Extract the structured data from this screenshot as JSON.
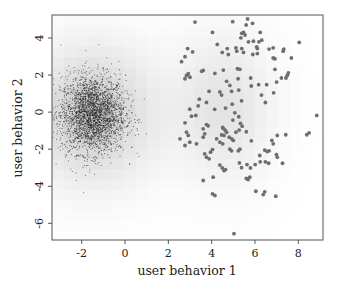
{
  "chart_data": {
    "type": "scatter",
    "title": "",
    "xlabel": "user behavior 1",
    "ylabel": "user behavior 2",
    "xlim": [
      -3.37,
      9.14
    ],
    "ylim": [
      -6.9,
      5.24
    ],
    "xticks": [
      -2,
      0,
      2,
      4,
      6,
      8
    ],
    "xtick_labels": [
      "-2",
      "0",
      "2",
      "4",
      "6",
      "8"
    ],
    "yticks": [
      -6,
      -4,
      -2,
      0,
      2,
      4
    ],
    "ytick_labels": [
      "-6",
      "-4",
      "-2",
      "0",
      "2",
      "4"
    ],
    "grid": false,
    "legend": null,
    "background": {
      "type": "heatmap",
      "description": "blocky grayscale density estimate, darkest near (-1.5, 0), fading to white toward right and bottom",
      "colormap": [
        "#ffffff",
        "#bdbdbd"
      ]
    },
    "series": [
      {
        "name": "dense cluster",
        "marker": "small dot",
        "color": "#222222",
        "center": [
          -1.5,
          -0.1
        ],
        "spread": [
          0.75,
          1.05
        ],
        "approx_count": 2500
      },
      {
        "name": "sparse cluster",
        "marker": "filled circle",
        "color": "#6e6e6e",
        "points": [
          [
            3.23,
            4.86
          ],
          [
            4.97,
            4.88
          ],
          [
            5.66,
            5.03
          ],
          [
            5.89,
            4.79
          ],
          [
            5.59,
            4.7
          ],
          [
            5.39,
            4.25
          ],
          [
            5.47,
            4.3
          ],
          [
            5.54,
            4.16
          ],
          [
            5.35,
            4.01
          ],
          [
            5.7,
            3.79
          ],
          [
            5.93,
            3.83
          ],
          [
            6.24,
            4.3
          ],
          [
            6.31,
            3.88
          ],
          [
            6.18,
            3.79
          ],
          [
            6.08,
            3.52
          ],
          [
            6.11,
            3.43
          ],
          [
            4.04,
            4.3
          ],
          [
            4.26,
            3.65
          ],
          [
            4.49,
            3.22
          ],
          [
            4.72,
            3.43
          ],
          [
            4.77,
            3.11
          ],
          [
            5.12,
            3.47
          ],
          [
            5.39,
            3.43
          ],
          [
            5.16,
            3.29
          ],
          [
            5.47,
            3.22
          ],
          [
            5.9,
            3.11
          ],
          [
            6.11,
            3.16
          ],
          [
            6.65,
            3.4
          ],
          [
            6.84,
            3.47
          ],
          [
            7.33,
            3.4
          ],
          [
            7.3,
            3.29
          ],
          [
            8.04,
            3.76
          ],
          [
            7.68,
            2.92
          ],
          [
            6.84,
            2.92
          ],
          [
            6.92,
            2.88
          ],
          [
            6.92,
            2.31
          ],
          [
            7.22,
            1.84
          ],
          [
            7.43,
            1.84
          ],
          [
            7.49,
            1.98
          ],
          [
            7.54,
            2.11
          ],
          [
            7.0,
            1.62
          ],
          [
            6.86,
            1.04
          ],
          [
            6.54,
            1.48
          ],
          [
            6.48,
            0.52
          ],
          [
            6.3,
            0.92
          ],
          [
            6.17,
            1.48
          ],
          [
            5.8,
            1.84
          ],
          [
            5.83,
            1.41
          ],
          [
            5.22,
            1.8
          ],
          [
            5.19,
            2.34
          ],
          [
            5.3,
            2.31
          ],
          [
            4.84,
            1.44
          ],
          [
            4.69,
            1.66
          ],
          [
            4.38,
            1.09
          ],
          [
            4.46,
            0.92
          ],
          [
            4.15,
            2.09
          ],
          [
            4.54,
            2.27
          ],
          [
            4.92,
            1.12
          ],
          [
            5.25,
            1.19
          ],
          [
            5.38,
            0.61
          ],
          [
            5.07,
            -0.04
          ],
          [
            5.25,
            -0.25
          ],
          [
            5.33,
            -0.61
          ],
          [
            5.41,
            -0.76
          ],
          [
            4.98,
            -0.43
          ],
          [
            4.95,
            0.43
          ],
          [
            4.64,
            0.22
          ],
          [
            4.54,
            -0.88
          ],
          [
            4.62,
            -0.97
          ],
          [
            4.51,
            -0.83
          ],
          [
            3.88,
            1.12
          ],
          [
            4.14,
            0.15
          ],
          [
            3.76,
            0.52
          ],
          [
            3.43,
            0.7
          ],
          [
            3.38,
            0.34
          ],
          [
            2.84,
            1.98
          ],
          [
            2.92,
            2.07
          ],
          [
            3.0,
            1.88
          ],
          [
            2.77,
            1.8
          ],
          [
            3.12,
            3.25
          ],
          [
            2.89,
            3.43
          ],
          [
            2.77,
            2.99
          ],
          [
            2.61,
            2.72
          ],
          [
            3.54,
            2.2
          ],
          [
            3.61,
            2.25
          ],
          [
            2.99,
            0.16
          ],
          [
            3.07,
            -0.22
          ],
          [
            3.27,
            -0.18
          ],
          [
            2.77,
            -0.58
          ],
          [
            2.84,
            -1.08
          ],
          [
            2.92,
            -1.26
          ],
          [
            2.99,
            -1.62
          ],
          [
            3.61,
            -0.9
          ],
          [
            3.68,
            -1.17
          ],
          [
            3.76,
            -0.67
          ],
          [
            3.84,
            -0.74
          ],
          [
            3.61,
            -1.35
          ],
          [
            3.3,
            -1.71
          ],
          [
            3.68,
            -2.25
          ],
          [
            3.76,
            -2.43
          ],
          [
            3.95,
            -2.16
          ],
          [
            4.04,
            -2.02
          ],
          [
            3.88,
            -2.52
          ],
          [
            4.23,
            -1.44
          ],
          [
            4.38,
            -1.62
          ],
          [
            4.46,
            -1.23
          ],
          [
            4.51,
            -1.71
          ],
          [
            4.57,
            -1.26
          ],
          [
            4.69,
            -1.08
          ],
          [
            4.81,
            -1.35
          ],
          [
            4.92,
            -1.44
          ],
          [
            5.0,
            -1.53
          ],
          [
            4.84,
            -2.0
          ],
          [
            4.92,
            -2.09
          ],
          [
            5.12,
            -1.08
          ],
          [
            5.23,
            -2.09
          ],
          [
            5.3,
            -2.0
          ],
          [
            5.27,
            -0.97
          ],
          [
            5.6,
            -1.06
          ],
          [
            5.83,
            -1.55
          ],
          [
            6.22,
            -2.34
          ],
          [
            6.45,
            -2.05
          ],
          [
            6.56,
            -2.13
          ],
          [
            6.65,
            -2.09
          ],
          [
            6.84,
            -1.71
          ],
          [
            6.78,
            -1.53
          ],
          [
            7.03,
            -1.26
          ],
          [
            7.42,
            -1.22
          ],
          [
            6.99,
            -2.29
          ],
          [
            7.03,
            -2.43
          ],
          [
            7.27,
            -2.76
          ],
          [
            6.63,
            -2.76
          ],
          [
            6.48,
            -2.68
          ],
          [
            6.24,
            -2.68
          ],
          [
            6.01,
            -2.83
          ],
          [
            5.63,
            -2.83
          ],
          [
            5.79,
            -3.01
          ],
          [
            4.38,
            -2.86
          ],
          [
            4.49,
            -3.01
          ],
          [
            4.57,
            -3.15
          ],
          [
            4.64,
            -3.1
          ],
          [
            3.61,
            -3.69
          ],
          [
            4.07,
            -3.51
          ],
          [
            4.04,
            -4.41
          ],
          [
            4.15,
            -4.5
          ],
          [
            5.6,
            -3.58
          ],
          [
            5.68,
            -3.64
          ],
          [
            5.76,
            -3.51
          ],
          [
            6.04,
            -4.27
          ],
          [
            6.38,
            -4.45
          ],
          [
            6.45,
            -4.3
          ],
          [
            6.96,
            -4.54
          ],
          [
            5.03,
            -6.56
          ],
          [
            5.28,
            -2.74
          ],
          [
            5.38,
            -3.0
          ],
          [
            8.85,
            -0.18
          ],
          [
            8.39,
            -1.22
          ],
          [
            8.5,
            -1.12
          ],
          [
            2.54,
            -1.44
          ],
          [
            2.77,
            -1.8
          ]
        ]
      }
    ]
  },
  "axes": {
    "xlabel": "user behavior 1",
    "ylabel": "user behavior 2"
  }
}
